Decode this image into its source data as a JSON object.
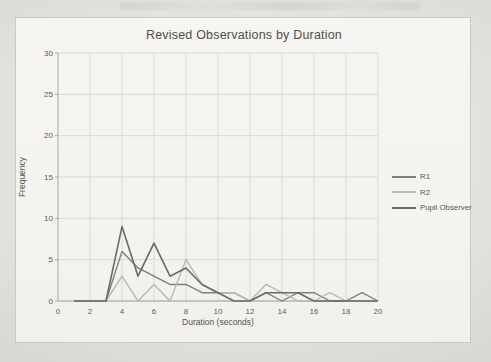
{
  "page": {
    "background_hex": "#e9e8e4",
    "frame_bg_hex": "#f4f3ef",
    "frame_border_hex": "#c9c8c4",
    "grid_hex": "#d9d8d3",
    "axis_hex": "#a9a8a3",
    "x_axis_hex": "#98978f",
    "text_hex": "#55544e"
  },
  "chart_data": {
    "type": "line",
    "title": "Revised Observations by Duration",
    "xlabel": "Duration (seconds)",
    "ylabel": "Frequency",
    "xlim": [
      0,
      20
    ],
    "ylim": [
      0,
      30
    ],
    "x_ticks": [
      0,
      2,
      4,
      6,
      8,
      10,
      12,
      14,
      16,
      18,
      20
    ],
    "y_ticks": [
      0,
      5,
      10,
      15,
      20,
      25,
      30
    ],
    "grid": true,
    "legend_position": "right",
    "x": [
      1,
      2,
      3,
      4,
      5,
      6,
      7,
      8,
      9,
      10,
      11,
      12,
      13,
      14,
      15,
      16,
      17,
      18,
      19,
      20
    ],
    "series": [
      {
        "name": "R1",
        "color_hex": "#807f7b",
        "stroke_width": 1.4,
        "values": [
          0,
          0,
          0,
          6,
          4,
          3,
          2,
          2,
          1,
          1,
          1,
          0,
          1,
          0,
          1,
          1,
          0,
          0,
          1,
          0
        ]
      },
      {
        "name": "R2",
        "color_hex": "#b9b8b3",
        "stroke_width": 1.4,
        "values": [
          0,
          0,
          0,
          3,
          0,
          2,
          0,
          5,
          2,
          1,
          1,
          0,
          2,
          1,
          0,
          0,
          1,
          0,
          0,
          0
        ]
      },
      {
        "name": "Pupil Observer",
        "color_hex": "#6b6a65",
        "stroke_width": 1.6,
        "values": [
          0,
          0,
          0,
          9,
          3,
          7,
          3,
          4,
          2,
          1,
          0,
          0,
          1,
          1,
          1,
          0,
          0,
          0,
          0,
          0
        ]
      }
    ]
  }
}
